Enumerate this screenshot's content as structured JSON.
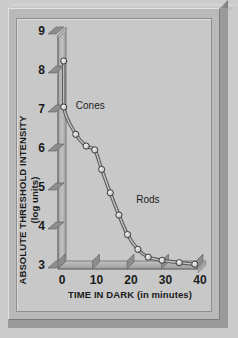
{
  "figure": {
    "background_color": "#cccccc",
    "panel_color": "#c8c8c8",
    "frame_color": "#b9b9b9"
  },
  "chart_data": {
    "type": "line",
    "title": "",
    "xlabel": "TIME IN DARK (in minutes)",
    "ylabel": "ABSOLUTE THRESHOLD INTENSITY",
    "ylabel_units": "(log units)",
    "xlim": [
      -2,
      42
    ],
    "ylim": [
      3,
      9
    ],
    "xticks": [
      0,
      10,
      20,
      30,
      40
    ],
    "xtick_labels": [
      "0",
      "10",
      "20",
      "30",
      "40"
    ],
    "yticks": [
      3,
      4,
      5,
      6,
      7,
      8,
      9
    ],
    "ytick_labels": [
      "3",
      "4",
      "5",
      "6",
      "7",
      "8",
      "9"
    ],
    "grid": false,
    "legend_position": "inline-annotation",
    "annotations": [
      {
        "text": "Cones",
        "x": 4.0,
        "y": 7.0
      },
      {
        "text": "Rods",
        "x": 21.5,
        "y": 4.6
      }
    ],
    "series": [
      {
        "name": "Absolute threshold during dark adaptation",
        "color": "#8f8f8f",
        "marker": "circle",
        "marker_color": "#d8d8d8",
        "x": [
          0.5,
          0.5,
          4.0,
          7.0,
          9.5,
          11.5,
          14.0,
          16.5,
          19.0,
          22.0,
          25.0,
          29.0,
          34.0,
          38.5
        ],
        "y": [
          8.23,
          7.05,
          6.35,
          6.05,
          5.95,
          5.45,
          4.85,
          4.28,
          3.78,
          3.4,
          3.2,
          3.12,
          3.06,
          3.02
        ]
      }
    ]
  }
}
